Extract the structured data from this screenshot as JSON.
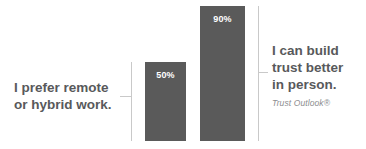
{
  "chart_data": {
    "type": "bar",
    "title": "",
    "xlabel": "",
    "ylabel": "",
    "ylim": [
      0,
      100
    ],
    "grid": false,
    "legend": "none",
    "categories": [
      "I prefer remote or hybrid work.",
      "I can build trust better in person."
    ],
    "values": [
      50,
      90
    ],
    "value_labels": [
      "50%",
      "90%"
    ],
    "annotations": [
      "Trust Outlook®"
    ],
    "bar_color": "#5a5a5a",
    "value_label_color": "#ffffff",
    "callout_text_color": "#58595b",
    "source_text_color": "#8d8e90",
    "leader_line_color": "#c9c9c9",
    "background_color": "#ffffff"
  },
  "bars": [
    {
      "id": "remote",
      "value_label": "50%",
      "value": 50
    },
    {
      "id": "trust",
      "value_label": "90%",
      "value": 90
    }
  ],
  "callouts": {
    "left": {
      "line1": "I prefer remote",
      "line2": "or hybrid work."
    },
    "right": {
      "line1": "I can build",
      "line2": "trust better",
      "line3": "in person.",
      "source": "Trust Outlook®"
    }
  }
}
